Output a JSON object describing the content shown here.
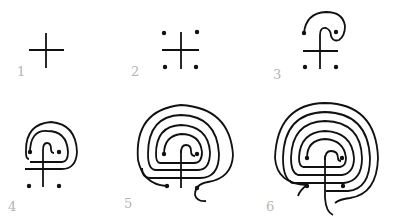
{
  "diagram": {
    "colors": {
      "line": "#111111",
      "label": "#b4b4b4",
      "background": "#ffffff"
    },
    "steps": [
      {
        "label": "1",
        "description": "Cross"
      },
      {
        "label": "2",
        "description": "Cross with four dots"
      },
      {
        "label": "3",
        "description": "First arc connects top of cross to upper-right dot"
      },
      {
        "label": "4",
        "description": "Second and third arcs added"
      },
      {
        "label": "5",
        "description": "Further circuits added"
      },
      {
        "label": "6",
        "description": "Completed seven-circuit labyrinth"
      }
    ]
  }
}
